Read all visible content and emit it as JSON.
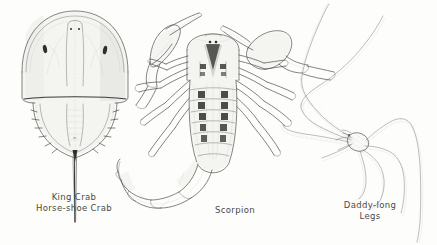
{
  "plate": {
    "title": "Arachnids and Chelicerates illustration plate",
    "background_color": "#fdfdfb",
    "ink_color": "#4f4f4d",
    "width": 437,
    "height": 245,
    "style": "pen-and-ink scientific engraving"
  },
  "figures": [
    {
      "id": "king-crab",
      "caption_lines": [
        "King Crab",
        "Horse-shoe Crab"
      ],
      "position": "left"
    },
    {
      "id": "scorpion",
      "caption_lines": [
        "Scorpion"
      ],
      "position": "center"
    },
    {
      "id": "daddy-long-legs",
      "caption_lines": [
        "Daddy-long",
        "Legs"
      ],
      "position": "right"
    }
  ],
  "captions": {
    "king_crab_line1": "King Crab",
    "king_crab_line2": "Horse-shoe Crab",
    "scorpion_line1": "Scorpion",
    "daddy_line1": "Daddy-long",
    "daddy_line2": "Legs"
  }
}
